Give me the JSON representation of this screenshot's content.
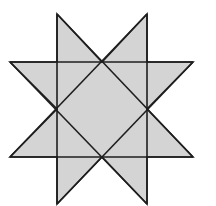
{
  "diagram": {
    "width": 216,
    "height": 206,
    "colors": {
      "background": "#ffffff",
      "fill": "#d4d4d4",
      "stroke": "#1e1e1e"
    },
    "stroke_width": 1.6,
    "outline": [
      [
        57,
        14
      ],
      [
        102,
        62
      ],
      [
        147,
        14
      ],
      [
        147,
        62
      ],
      [
        193,
        62
      ],
      [
        147,
        109
      ],
      [
        193,
        157
      ],
      [
        147,
        157
      ],
      [
        147,
        204
      ],
      [
        102,
        157
      ],
      [
        57,
        204
      ],
      [
        57,
        157
      ],
      [
        10,
        157
      ],
      [
        57,
        109
      ],
      [
        10,
        62
      ],
      [
        57,
        62
      ]
    ],
    "lines": [
      {
        "name": "left-vertical-line",
        "from": [
          57,
          14
        ],
        "to": [
          57,
          204
        ]
      },
      {
        "name": "right-vertical-line",
        "from": [
          147,
          14
        ],
        "to": [
          147,
          204
        ]
      },
      {
        "name": "top-horizontal-line",
        "from": [
          10,
          62
        ],
        "to": [
          193,
          62
        ]
      },
      {
        "name": "bottom-horizontal-line",
        "from": [
          10,
          157
        ],
        "to": [
          193,
          157
        ]
      },
      {
        "name": "diagonal-line-1",
        "from": [
          57,
          14
        ],
        "to": [
          193,
          157
        ]
      },
      {
        "name": "diagonal-line-2",
        "from": [
          147,
          14
        ],
        "to": [
          10,
          157
        ]
      },
      {
        "name": "diagonal-line-3",
        "from": [
          10,
          62
        ],
        "to": [
          147,
          204
        ]
      },
      {
        "name": "diagonal-line-4",
        "from": [
          193,
          62
        ],
        "to": [
          57,
          204
        ]
      }
    ]
  }
}
